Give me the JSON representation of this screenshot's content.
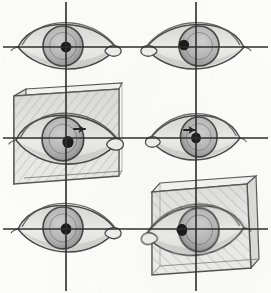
{
  "artwork": {
    "title": "Eye Construction Study",
    "medium": "graphite pencil sketch",
    "description": "Six eye drawings laid out on a three-by-two crosshair grid; two of the eyes are enclosed in shaded three-dimensional rectangular boxes showing perspective.",
    "canvas": {
      "width": 271,
      "height": 293,
      "background": "#fdfdfc"
    },
    "palette": {
      "pencil_line": "#3a3a3a",
      "pencil_line_soft": "#6b6b6b",
      "guide_line": "#2e2e2e",
      "pupil": "#1a1a1a",
      "iris_fill": "#b9b9b9",
      "sclera_fill": "#e8e8e6",
      "box_face_fill": "#e9e9e7",
      "box_side_fill": "#d6d6d3",
      "box_top_fill": "#f2f2f0",
      "shadow": "#a9a9a6"
    }
  },
  "guides": {
    "label": "crosshair construction grid",
    "vertical_lines": [
      {
        "name": "vertical-axis-left",
        "x": 66
      },
      {
        "name": "vertical-axis-right",
        "x": 196
      }
    ],
    "horizontal_lines": [
      {
        "name": "horizontal-axis-top",
        "y": 47
      },
      {
        "name": "horizontal-axis-middle",
        "y": 138
      },
      {
        "name": "horizontal-axis-bottom",
        "y": 229
      }
    ]
  },
  "cells": [
    {
      "id": "eye-top-left",
      "label": "Eye top left",
      "row": "top",
      "column": "left",
      "center": {
        "x": 66,
        "y": 47
      },
      "boxed": false,
      "arrow": false,
      "tear_duct_side": "right",
      "pupil_offset_x": 0,
      "pupil_offset_y": 0,
      "eye_width": 96,
      "eye_height": 42,
      "rotation": 0,
      "note": "Front view, pupil centered on the crosshair intersection."
    },
    {
      "id": "eye-top-right",
      "label": "Eye top right",
      "row": "top",
      "column": "right",
      "center": {
        "x": 196,
        "y": 47
      },
      "boxed": false,
      "arrow": false,
      "tear_duct_side": "left",
      "pupil_offset_x": -12,
      "pupil_offset_y": -2,
      "eye_width": 96,
      "eye_height": 42,
      "rotation": 0,
      "note": "Mirrored eye, pupil shifted left of the vertical axis."
    },
    {
      "id": "eye-middle-left",
      "label": "Eye middle left in box",
      "row": "middle",
      "column": "left",
      "center": {
        "x": 66,
        "y": 140
      },
      "boxed": true,
      "arrow": true,
      "tear_duct_side": "right",
      "pupil_offset_x": 2,
      "pupil_offset_y": 2,
      "eye_width": 100,
      "eye_height": 46,
      "rotation": 0,
      "note": "Eye constructed inside a shaded perspective box; small direction arrow above the pupil."
    },
    {
      "id": "eye-middle-right",
      "label": "Eye middle right",
      "row": "middle",
      "column": "right",
      "center": {
        "x": 196,
        "y": 138
      },
      "boxed": false,
      "arrow": true,
      "tear_duct_side": "left",
      "pupil_offset_x": 0,
      "pupil_offset_y": 0,
      "eye_width": 88,
      "eye_height": 42,
      "rotation": 0,
      "note": "Mirrored eye with direction arrow pointing right toward the pupil."
    },
    {
      "id": "eye-bottom-left",
      "label": "Eye bottom left",
      "row": "bottom",
      "column": "left",
      "center": {
        "x": 66,
        "y": 229
      },
      "boxed": false,
      "arrow": false,
      "tear_duct_side": "right",
      "pupil_offset_x": 0,
      "pupil_offset_y": 0,
      "eye_width": 96,
      "eye_height": 44,
      "rotation": 0,
      "note": "Front view repeated, pupil on the crosshair intersection."
    },
    {
      "id": "eye-bottom-right",
      "label": "Eye bottom right in box",
      "row": "bottom",
      "column": "right",
      "center": {
        "x": 196,
        "y": 231
      },
      "boxed": true,
      "arrow": false,
      "tear_duct_side": "left",
      "pupil_offset_x": -14,
      "pupil_offset_y": -2,
      "eye_width": 96,
      "eye_height": 46,
      "rotation": -4,
      "note": "Eye inside a tilted perspective box, pupil shifted left."
    }
  ],
  "boxes": [
    {
      "id": "box-middle-left",
      "label": "Perspective box middle left",
      "front_face": [
        [
          14,
          96
        ],
        [
          119,
          89
        ],
        [
          119,
          176
        ],
        [
          14,
          184
        ]
      ],
      "top_face": [
        [
          14,
          96
        ],
        [
          26,
          89
        ],
        [
          122,
          84
        ],
        [
          119,
          89
        ]
      ],
      "side_face": [
        [
          14,
          96
        ],
        [
          14,
          184
        ],
        [
          24,
          178
        ],
        [
          26,
          89
        ]
      ],
      "visible_sides": [
        "front",
        "top",
        "left"
      ]
    },
    {
      "id": "box-bottom-right",
      "label": "Perspective box bottom right",
      "front_face": [
        [
          152,
          192
        ],
        [
          247,
          184
        ],
        [
          251,
          268
        ],
        [
          152,
          275
        ]
      ],
      "top_face": [
        [
          152,
          192
        ],
        [
          160,
          184
        ],
        [
          256,
          176
        ],
        [
          247,
          184
        ]
      ],
      "side_face": [
        [
          247,
          184
        ],
        [
          256,
          176
        ],
        [
          259,
          260
        ],
        [
          251,
          268
        ]
      ],
      "visible_sides": [
        "front",
        "top",
        "right"
      ]
    }
  ],
  "arrows": [
    {
      "id": "arrow-middle-left",
      "x": 74,
      "y": 129,
      "direction": "right",
      "length": 13
    },
    {
      "id": "arrow-middle-right",
      "x": 184,
      "y": 130,
      "direction": "right",
      "length": 13
    }
  ]
}
